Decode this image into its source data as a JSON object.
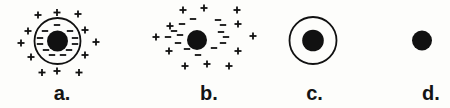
{
  "ink": "#111111",
  "background": "#fdfdfb",
  "marks_style": {
    "plus_half": 3.5,
    "minus_half": 3.2,
    "stroke_width": 1.8,
    "circle_stroke": 1.8
  },
  "figures": [
    {
      "id": "a",
      "label": "a.",
      "center": {
        "x": 57.5,
        "y": 41
      },
      "outer_circle": {
        "r": 23
      },
      "core": {
        "r": 10.5
      },
      "plus_marks": [
        [
          38,
          15
        ],
        [
          57,
          12.5
        ],
        [
          78,
          14
        ],
        [
          28,
          31
        ],
        [
          21,
          43
        ],
        [
          31,
          57
        ],
        [
          85,
          30
        ],
        [
          96,
          42
        ],
        [
          85,
          55
        ],
        [
          42,
          72.5
        ],
        [
          57,
          71
        ],
        [
          79,
          72.5
        ]
      ],
      "minus_marks": [
        [
          57,
          25
        ],
        [
          45,
          31
        ],
        [
          70,
          31
        ],
        [
          40,
          38
        ],
        [
          75,
          38
        ],
        [
          40,
          44
        ],
        [
          75,
          44
        ],
        [
          46,
          50
        ],
        [
          69,
          50
        ],
        [
          52,
          55
        ],
        [
          63,
          55
        ]
      ],
      "label_pos": {
        "x": 62,
        "y": 100
      }
    },
    {
      "id": "b",
      "label": "b.",
      "center": {
        "x": 197,
        "y": 40
      },
      "outer_circle": null,
      "core": {
        "r": 10
      },
      "plus_marks": [
        [
          183,
          10
        ],
        [
          204,
          8
        ],
        [
          237,
          10
        ],
        [
          170,
          26
        ],
        [
          238,
          24
        ],
        [
          156,
          37
        ],
        [
          253,
          36
        ],
        [
          169,
          51
        ],
        [
          238,
          51
        ],
        [
          185,
          66
        ],
        [
          207,
          64
        ],
        [
          229,
          66
        ]
      ],
      "minus_marks": [
        [
          193,
          19
        ],
        [
          182,
          24
        ],
        [
          218,
          20
        ],
        [
          223,
          25
        ],
        [
          174,
          31
        ],
        [
          180,
          35
        ],
        [
          168,
          37
        ],
        [
          178,
          43
        ],
        [
          187,
          49
        ],
        [
          198,
          55
        ],
        [
          214,
          48
        ],
        [
          221,
          32
        ],
        [
          226,
          37
        ],
        [
          223,
          43
        ]
      ],
      "label_pos": {
        "x": 209,
        "y": 100
      }
    },
    {
      "id": "c",
      "label": "c.",
      "center": {
        "x": 313,
        "y": 40.5
      },
      "outer_circle": {
        "r": 23.5
      },
      "core": {
        "r": 10.8
      },
      "plus_marks": [],
      "minus_marks": [],
      "label_pos": {
        "x": 314.5,
        "y": 100
      }
    },
    {
      "id": "d",
      "label": "d.",
      "center": {
        "x": 422,
        "y": 40.5
      },
      "outer_circle": null,
      "core": {
        "r": 10
      },
      "plus_marks": [],
      "minus_marks": [],
      "label_pos": {
        "x": 431,
        "y": 100
      }
    }
  ]
}
